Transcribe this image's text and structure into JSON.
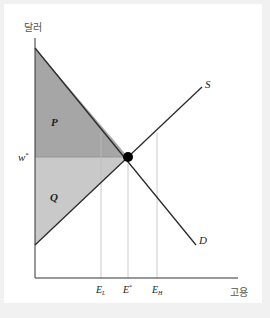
{
  "diagram": {
    "type": "labor-market-supply-demand",
    "y_axis_label": "달러",
    "x_axis_label": "고용",
    "curves": {
      "supply": {
        "label": "S"
      },
      "demand": {
        "label": "D"
      }
    },
    "price_label": "w",
    "price_label_sup": "*",
    "regions": {
      "upper": {
        "label": "P",
        "color": "#a6a6a6"
      },
      "lower": {
        "label": "Q",
        "color": "#c9c9c9"
      }
    },
    "x_ticks": [
      {
        "base": "E",
        "sub": "L"
      },
      {
        "base": "E",
        "sup": "*"
      },
      {
        "base": "E",
        "sub": "H"
      }
    ],
    "equilibrium_point": {
      "color": "#000000"
    },
    "colors": {
      "axis": "#333333",
      "curve": "#2a2a2a",
      "guide": "#bdbdbd",
      "background": "#f1f1f1",
      "card": "#ffffff"
    }
  }
}
